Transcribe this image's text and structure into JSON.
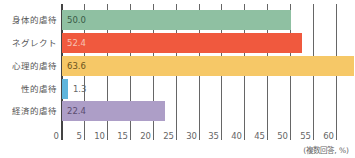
{
  "chart_data": {
    "type": "bar",
    "orientation": "horizontal",
    "title": "",
    "xlabel": "",
    "ylabel": "",
    "note": "(複数回答, %)",
    "categories": [
      "身体的虐待",
      "ネグレクト",
      "心理的虐待",
      "性的虐待",
      "経済的虐待"
    ],
    "values": [
      50.0,
      52.4,
      63.6,
      1.3,
      22.4
    ],
    "value_labels": [
      "50.0",
      "52.4",
      "63.6",
      "1.3",
      "22.4"
    ],
    "colors": [
      "#8fc0a2",
      "#f0593e",
      "#f6c867",
      "#5fb5dc",
      "#ad9ec7"
    ],
    "value_text_colors": [
      "#3a5a46",
      "#f7c2b4",
      "#6b5420",
      "#666666",
      "#5b4c70"
    ],
    "xlim": [
      0,
      60
    ],
    "xticks": [
      "0",
      "5",
      "10",
      "15",
      "20",
      "25",
      "30",
      "35",
      "40",
      "45",
      "50",
      "55",
      "60"
    ],
    "grid": true,
    "legend": null
  }
}
